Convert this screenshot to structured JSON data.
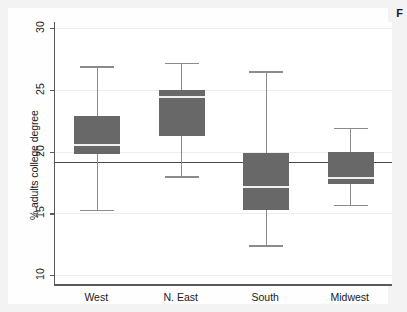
{
  "figure": {
    "caption_fragment": "F",
    "background_color": "#f3f3f3",
    "plot_background_color": "#ffffff",
    "box_fill_color": "#686868",
    "whisker_color": "#8b8b8b",
    "median_color": "#f0f0f0",
    "axis_color": "#5a5a5a",
    "reference_line_color": "#4a4a4a"
  },
  "chart_data": {
    "type": "box",
    "title": "",
    "xlabel": "",
    "ylabel": "% adults college degree",
    "ylim": [
      9.2,
      30.5
    ],
    "yticks": [
      10,
      15,
      20,
      25,
      30
    ],
    "ytick_labels": [
      "10",
      "15",
      "20",
      "25",
      "30"
    ],
    "grid": true,
    "legend": "none",
    "categories": [
      "West",
      "N. East",
      "South",
      "Midwest"
    ],
    "reference_line": 19.2,
    "boxes": [
      {
        "category": "West",
        "whisker_low": 15.3,
        "q1": 19.8,
        "median": 20.5,
        "q3": 22.9,
        "whisker_high": 26.9
      },
      {
        "category": "N. East",
        "whisker_low": 18.0,
        "q1": 21.3,
        "median": 24.4,
        "q3": 25.0,
        "whisker_high": 27.2
      },
      {
        "category": "South",
        "whisker_low": 12.4,
        "q1": 15.3,
        "median": 17.1,
        "q3": 19.9,
        "whisker_high": 26.5
      },
      {
        "category": "Midwest",
        "whisker_low": 15.7,
        "q1": 17.4,
        "median": 17.9,
        "q3": 20.0,
        "whisker_high": 21.9
      }
    ]
  }
}
